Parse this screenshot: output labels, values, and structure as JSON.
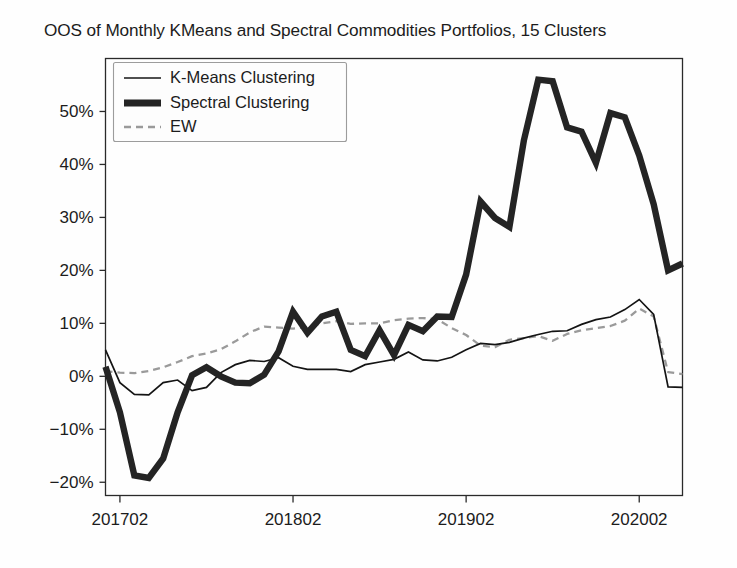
{
  "figure": {
    "title": "OOS of Monthly KMeans and Spectral Commodities Portfolios, 15 Clusters",
    "background_color": "#fefefe"
  },
  "chart_data": {
    "type": "line",
    "title": "OOS of Monthly KMeans and Spectral Commodities Portfolios, 15 Clusters",
    "xlabel": "",
    "ylabel": "",
    "grid": false,
    "legend_position": "upper-left",
    "xlim": [
      0,
      40
    ],
    "ylim": [
      -0.225,
      0.6
    ],
    "y_tick_values": [
      -0.2,
      -0.1,
      0.0,
      0.1,
      0.2,
      0.3,
      0.4,
      0.5
    ],
    "y_tick_labels": [
      "−20%",
      "−10%",
      "0%",
      "10%",
      "20%",
      "30%",
      "40%",
      "50%"
    ],
    "x_tick_indices": [
      1,
      13,
      25,
      37
    ],
    "x_tick_labels": [
      "201702",
      "201802",
      "201902",
      "202002"
    ],
    "x": [
      "201701",
      "201702",
      "201703",
      "201704",
      "201705",
      "201706",
      "201707",
      "201708",
      "201709",
      "201710",
      "201711",
      "201712",
      "201801",
      "201802",
      "201803",
      "201804",
      "201805",
      "201806",
      "201807",
      "201808",
      "201809",
      "201810",
      "201811",
      "201812",
      "201901",
      "201902",
      "201903",
      "201904",
      "201905",
      "201906",
      "201907",
      "201908",
      "201909",
      "201910",
      "201911",
      "201912",
      "202001",
      "202002",
      "202003",
      "202004",
      "202005"
    ],
    "colors": {
      "kmeans": "#141414",
      "spectral": "#242424",
      "ew": "#9a9a9a"
    },
    "series": [
      {
        "name": "K-Means Clustering",
        "style": "solid-thin",
        "values": [
          0.05,
          -0.012,
          -0.034,
          -0.035,
          -0.012,
          -0.007,
          -0.027,
          -0.021,
          0.007,
          0.022,
          0.03,
          0.028,
          0.035,
          0.019,
          0.013,
          0.013,
          0.013,
          0.009,
          0.022,
          0.027,
          0.032,
          0.046,
          0.031,
          0.029,
          0.036,
          0.05,
          0.062,
          0.06,
          0.064,
          0.072,
          0.079,
          0.085,
          0.086,
          0.098,
          0.107,
          0.112,
          0.126,
          0.145,
          0.117,
          -0.02,
          -0.021
        ]
      },
      {
        "name": "Spectral Clustering",
        "style": "solid-thick",
        "values": [
          0.018,
          -0.068,
          -0.187,
          -0.192,
          -0.155,
          -0.068,
          0.002,
          0.017,
          0.0,
          -0.012,
          -0.013,
          0.003,
          0.047,
          0.122,
          0.082,
          0.113,
          0.122,
          0.05,
          0.038,
          0.087,
          0.04,
          0.097,
          0.085,
          0.113,
          0.112,
          0.192,
          0.33,
          0.299,
          0.282,
          0.445,
          0.56,
          0.557,
          0.47,
          0.462,
          0.403,
          0.497,
          0.489,
          0.417,
          0.325,
          0.2,
          0.213
        ]
      },
      {
        "name": "EW",
        "style": "dashed",
        "values": [
          0.01,
          0.007,
          0.006,
          0.01,
          0.017,
          0.027,
          0.038,
          0.043,
          0.051,
          0.066,
          0.083,
          0.094,
          0.092,
          0.09,
          0.093,
          0.1,
          0.104,
          0.099,
          0.1,
          0.1,
          0.106,
          0.109,
          0.11,
          0.108,
          0.091,
          0.078,
          0.058,
          0.055,
          0.069,
          0.072,
          0.076,
          0.067,
          0.08,
          0.087,
          0.091,
          0.095,
          0.105,
          0.128,
          0.113,
          0.008,
          0.004
        ]
      }
    ]
  },
  "legend": {
    "items": [
      {
        "label": "K-Means Clustering",
        "marker": "thin-line-marker"
      },
      {
        "label": "Spectral Clustering",
        "marker": "thick-line-marker"
      },
      {
        "label": "EW",
        "marker": "dashed-line-marker"
      }
    ]
  }
}
